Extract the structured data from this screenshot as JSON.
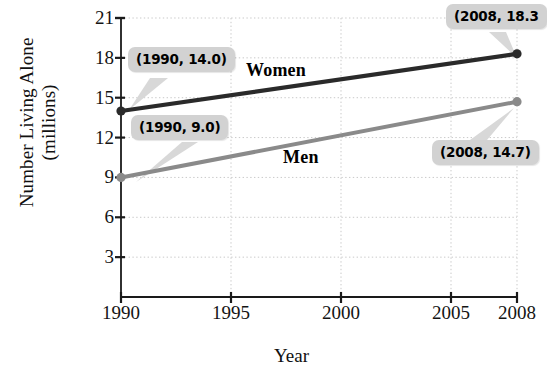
{
  "chart_data": {
    "type": "line",
    "title": "",
    "xlabel": "Year",
    "ylabel": "Number Living Alone (millions)",
    "ylabel_line1": "Number Living Alone",
    "ylabel_line2": "(millions)",
    "x": [
      1990,
      2008
    ],
    "xlim": [
      1990,
      2008
    ],
    "ylim": [
      0,
      21
    ],
    "xticks": [
      "1990",
      "1995",
      "2000",
      "2005",
      "2008"
    ],
    "xtick_values": [
      1990,
      1995,
      2000,
      2005,
      2008
    ],
    "yticks": [
      "3",
      "6",
      "9",
      "12",
      "15",
      "18",
      "21"
    ],
    "ytick_values": [
      3,
      6,
      9,
      12,
      15,
      18,
      21
    ],
    "grid": "dotted both axes",
    "legend_position": "inline labels on lines",
    "series": [
      {
        "name": "Women",
        "color": "#2a2a2a",
        "values": [
          14.0,
          18.3
        ],
        "label_text": "Women"
      },
      {
        "name": "Men",
        "color": "#8a8a8a",
        "values": [
          9.0,
          14.7
        ],
        "label_text": "Men"
      }
    ],
    "annotations": [
      {
        "text": "(1990, 14.0)",
        "series": "Women",
        "point": [
          1990,
          14.0
        ]
      },
      {
        "text": "(2008, 18.3",
        "series": "Women",
        "point": [
          2008,
          18.3
        ],
        "clipped": true
      },
      {
        "text": "(1990, 9.0)",
        "series": "Men",
        "point": [
          1990,
          9.0
        ]
      },
      {
        "text": "(2008, 14.7)",
        "series": "Men",
        "point": [
          2008,
          14.7
        ]
      }
    ]
  },
  "colors": {
    "women_line": "#2a2a2a",
    "men_line": "#8a8a8a",
    "callout_bg": "#d2d2d2",
    "grid": "#c9c9c9",
    "axis": "#1a1a1a"
  }
}
